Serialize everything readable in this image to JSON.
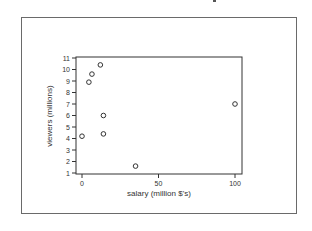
{
  "chart_data": {
    "type": "scatter",
    "title": "",
    "xlabel": "salary (million $'s)",
    "ylabel": "viewers (millions)",
    "xlim": [
      -3,
      104
    ],
    "ylim": [
      1,
      11
    ],
    "x_ticks": [
      0,
      50,
      100
    ],
    "y_ticks": [
      1,
      2,
      3,
      4,
      5,
      6,
      7,
      8,
      9,
      10,
      11
    ],
    "grid": false,
    "legend": null,
    "marker": "open-circle",
    "points": [
      {
        "x": 0,
        "y": 4.2
      },
      {
        "x": 4.5,
        "y": 8.9
      },
      {
        "x": 6.5,
        "y": 9.6
      },
      {
        "x": 12,
        "y": 10.4
      },
      {
        "x": 14,
        "y": 6.0
      },
      {
        "x": 14,
        "y": 4.4
      },
      {
        "x": 35,
        "y": 1.6
      },
      {
        "x": 100,
        "y": 7.0
      }
    ]
  },
  "colors": {
    "axis": "#333333",
    "frame": "#6a6a6a",
    "marker": "#333333",
    "background": "#ffffff"
  }
}
